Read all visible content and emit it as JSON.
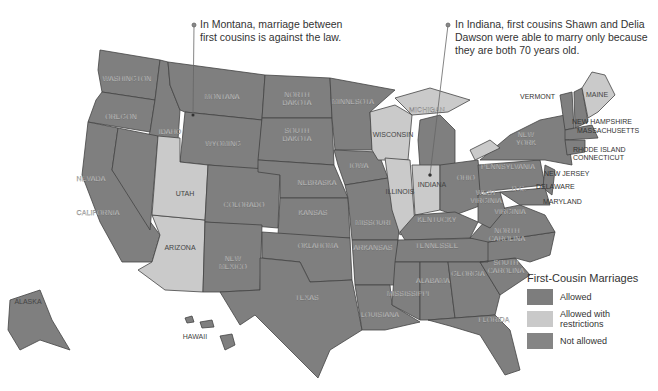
{
  "annotations": [
    {
      "id": "montana",
      "text_line1": "In Montana, marriage between",
      "text_line2": "first cousins is against the law.",
      "text_line3": ""
    },
    {
      "id": "indiana",
      "text_line1": "In Indiana, first cousins Shawn and Delia",
      "text_line2": "Dawson were able to marry only because",
      "text_line3": "they are both 70 years old."
    }
  ],
  "legend": {
    "title": "First-Cousin Marriages",
    "items": [
      {
        "label": "Allowed",
        "label2": "",
        "color": "#7d7d7d"
      },
      {
        "label": "Allowed with",
        "label2": "restrictions",
        "color": "#c9c9c9"
      },
      {
        "label": "Not allowed",
        "label2": "",
        "color": "#858585"
      }
    ]
  },
  "colors": {
    "dark": "#7f7f7f",
    "light": "#cacaca",
    "border": "#444444"
  },
  "states": {
    "washington": "WASHINGTON",
    "oregon": "OREGON",
    "idaho": "IDAHO",
    "montana": "MONTANA",
    "wyoming": "WYOMING",
    "north_dakota_1": "NORTH",
    "north_dakota_2": "DAKOTA",
    "south_dakota_1": "SOUTH",
    "south_dakota_2": "DAKOTA",
    "minnesota": "MINNESOTA",
    "wisconsin": "WISCONSIN",
    "michigan": "MICHIGAN",
    "nevada": "NEVADA",
    "utah": "UTAH",
    "colorado": "COLORADO",
    "nebraska": "NEBRASKA",
    "iowa": "IOWA",
    "illinois": "ILLINOIS",
    "indiana": "INDIANA",
    "ohio": "OHIO",
    "california": "CALIFORNIA",
    "arizona": "ARIZONA",
    "new_mexico_1": "NEW",
    "new_mexico_2": "MEXICO",
    "kansas": "KANSAS",
    "missouri": "MISSOURI",
    "kentucky": "KENTUCKY",
    "oklahoma": "OKLAHOMA",
    "arkansas": "ARKANSAS",
    "tennessee": "TENNESSEE",
    "texas": "TEXAS",
    "louisiana": "LOUISIANA",
    "mississippi": "MISSISSIPPI",
    "alabama": "ALABAMA",
    "georgia": "GEORGIA",
    "florida": "FLORIDA",
    "south_carolina_1": "SOUTH",
    "south_carolina_2": "CAROLINA",
    "north_carolina_1": "NORTH",
    "north_carolina_2": "CAROLINA",
    "virginia": "VIRGINIA",
    "west_virginia_1": "WEST",
    "west_virginia_2": "VIRGINIA",
    "pennsylvania": "PENNSYLVANIA",
    "new_york_1": "NEW",
    "new_york_2": "YORK",
    "vermont": "VERMONT",
    "maine": "MAINE",
    "new_hampshire": "NEW HAMPSHIRE",
    "massachusetts": "MASSACHUSETTS",
    "rhode_island": "RHODE ISLAND",
    "connecticut": "CONNECTICUT",
    "new_jersey": "NEW JERSEY",
    "delaware": "DELAWARE",
    "maryland": "MARYLAND",
    "dc": "D.C.",
    "alaska": "ALASKA",
    "hawaii": "HAWAII"
  }
}
